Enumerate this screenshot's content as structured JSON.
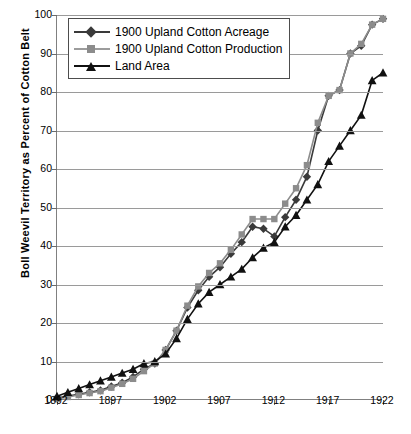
{
  "chart_data": {
    "type": "line",
    "title": "",
    "xlabel": "",
    "ylabel": "Boll Weevil Territory as Percent of Cotton Belt",
    "xlim": [
      1892,
      1922
    ],
    "ylim": [
      0,
      100
    ],
    "grid": true,
    "legend_position": "top-left",
    "xticks": [
      1892,
      1897,
      1902,
      1907,
      1912,
      1917,
      1922
    ],
    "yticks": [
      0,
      10,
      20,
      30,
      40,
      50,
      60,
      70,
      80,
      90,
      100
    ],
    "x": [
      1892,
      1893,
      1894,
      1895,
      1896,
      1897,
      1898,
      1899,
      1900,
      1901,
      1902,
      1903,
      1904,
      1905,
      1906,
      1907,
      1908,
      1909,
      1910,
      1911,
      1912,
      1913,
      1914,
      1915,
      1916,
      1917,
      1918,
      1919,
      1920,
      1921,
      1922
    ],
    "series": [
      {
        "name": "1900 Upland Cotton Acreage",
        "marker": "diamond",
        "color": "#3a3a3a",
        "values": [
          0.5,
          1,
          1.5,
          2,
          2.5,
          3.5,
          4.5,
          6,
          8,
          9.5,
          13,
          18,
          24,
          28.5,
          32,
          34.5,
          38,
          41,
          45,
          44.5,
          42.5,
          47.5,
          52,
          58,
          70,
          79,
          80.5,
          90,
          92,
          97.5,
          99
        ]
      },
      {
        "name": "1900 Upland Cotton Production",
        "marker": "square",
        "color": "#8c8c8c",
        "values": [
          0.3,
          0.8,
          1.3,
          1.8,
          2.3,
          3.2,
          4.2,
          5.5,
          7.5,
          9.5,
          13,
          18,
          24.5,
          29.5,
          33,
          35.5,
          39,
          43,
          47,
          47,
          47,
          51,
          55,
          61,
          72,
          79,
          80.5,
          90,
          92.5,
          97.5,
          99
        ]
      },
      {
        "name": "Land Area",
        "marker": "triangle",
        "color": "#111111",
        "values": [
          1,
          2,
          3,
          4,
          5,
          6,
          7,
          8,
          9.5,
          10,
          12,
          16,
          21,
          25,
          28,
          30,
          32,
          34,
          37,
          39.5,
          41,
          45,
          48,
          52,
          56,
          62,
          66,
          70,
          74,
          83,
          85
        ]
      }
    ]
  },
  "axis": {
    "y_labels": [
      "100",
      "90",
      "80",
      "70",
      "60",
      "50",
      "40",
      "30",
      "20",
      "10",
      "0"
    ],
    "x_labels": [
      "1892",
      "1897",
      "1902",
      "1907",
      "1912",
      "1917",
      "1922"
    ],
    "y_title": "Boll Weevil Territory as Percent of Cotton Belt"
  },
  "legend": {
    "items": [
      {
        "label": "1900 Upland Cotton Acreage",
        "marker": "diamond-marker"
      },
      {
        "label": "1900 Upland Cotton Production",
        "marker": "square-marker"
      },
      {
        "label": "Land Area",
        "marker": "triangle-marker"
      }
    ]
  }
}
